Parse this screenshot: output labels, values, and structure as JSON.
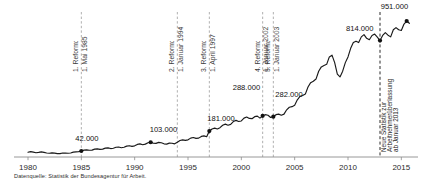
{
  "source_note": "Datenquelle: Statistik der Bundesagentur für Arbeit.",
  "chart_data": {
    "type": "line",
    "title": "",
    "subtitle": "",
    "xlabel": "",
    "ylabel": "",
    "grid": false,
    "legend": "none",
    "xlim": [
      1980,
      2016
    ],
    "ylim": [
      0,
      1000000
    ],
    "x_tick_labels": [
      "1980",
      "1985",
      "1990",
      "1995",
      "2000",
      "2005",
      "2010",
      "2015"
    ],
    "x_ticks": [
      1980,
      1985,
      1990,
      1995,
      2000,
      2005,
      2010,
      2015
    ],
    "series": [
      {
        "name": "Zeitarbeitnehmer",
        "color": "#1a1a1a",
        "x": [
          1980.0,
          1980.25,
          1980.5,
          1980.75,
          1981.0,
          1981.25,
          1981.5,
          1981.75,
          1982.0,
          1982.25,
          1982.5,
          1982.75,
          1983.0,
          1983.25,
          1983.5,
          1983.75,
          1984.0,
          1984.25,
          1984.5,
          1984.75,
          1985.0,
          1985.25,
          1985.5,
          1985.75,
          1986.0,
          1986.25,
          1986.5,
          1986.75,
          1987.0,
          1987.25,
          1987.5,
          1987.75,
          1988.0,
          1988.25,
          1988.5,
          1988.75,
          1989.0,
          1989.25,
          1989.5,
          1989.75,
          1990.0,
          1990.25,
          1990.5,
          1990.75,
          1991.0,
          1991.25,
          1991.5,
          1991.75,
          1992.0,
          1992.25,
          1992.5,
          1992.75,
          1993.0,
          1993.25,
          1993.5,
          1993.75,
          1994.0,
          1994.25,
          1994.5,
          1994.75,
          1995.0,
          1995.25,
          1995.5,
          1995.75,
          1996.0,
          1996.25,
          1996.5,
          1996.75,
          1997.0,
          1997.25,
          1997.5,
          1997.75,
          1998.0,
          1998.25,
          1998.5,
          1998.75,
          1999.0,
          1999.25,
          1999.5,
          1999.75,
          2000.0,
          2000.25,
          2000.5,
          2000.75,
          2001.0,
          2001.25,
          2001.5,
          2001.75,
          2002.0,
          2002.25,
          2002.5,
          2002.75,
          2003.0,
          2003.25,
          2003.5,
          2003.75,
          2004.0,
          2004.25,
          2004.5,
          2004.75,
          2005.0,
          2005.25,
          2005.5,
          2005.75,
          2006.0,
          2006.25,
          2006.5,
          2006.75,
          2007.0,
          2007.25,
          2007.5,
          2007.75,
          2008.0,
          2008.25,
          2008.5,
          2008.75,
          2009.0,
          2009.25,
          2009.5,
          2009.75,
          2010.0,
          2010.25,
          2010.5,
          2010.75,
          2011.0,
          2011.25,
          2011.5,
          2011.75,
          2012.0,
          2012.25,
          2012.5,
          2012.75,
          2013.0,
          2013.25,
          2013.5,
          2013.75,
          2014.0,
          2014.25,
          2014.5,
          2014.75,
          2015.0,
          2015.25,
          2015.5,
          2015.75
        ],
        "values": [
          33000,
          38000,
          34000,
          30000,
          32000,
          36000,
          32000,
          28000,
          26000,
          29000,
          27000,
          24000,
          24000,
          28000,
          27000,
          26000,
          28000,
          34000,
          36000,
          38000,
          42000,
          48000,
          50000,
          47000,
          48000,
          55000,
          57000,
          53000,
          55000,
          62000,
          64000,
          59000,
          61000,
          68000,
          70000,
          65000,
          68000,
          76000,
          79000,
          74000,
          78000,
          88000,
          92000,
          86000,
          90000,
          100000,
          103000,
          96000,
          95000,
          102000,
          100000,
          92000,
          90000,
          97000,
          96000,
          92000,
          103000,
          115000,
          120000,
          116000,
          120000,
          132000,
          136000,
          130000,
          132000,
          144000,
          148000,
          142000,
          181000,
          196000,
          202000,
          196000,
          205000,
          222000,
          230000,
          222000,
          228000,
          248000,
          256000,
          248000,
          252000,
          272000,
          280000,
          270000,
          268000,
          282000,
          286000,
          272000,
          288000,
          296000,
          292000,
          276000,
          282000,
          296000,
          300000,
          292000,
          300000,
          330000,
          348000,
          352000,
          362000,
          400000,
          424000,
          430000,
          440000,
          490000,
          520000,
          530000,
          545000,
          600000,
          630000,
          640000,
          648000,
          700000,
          712000,
          660000,
          580000,
          560000,
          600000,
          660000,
          700000,
          760000,
          800000,
          810000,
          800000,
          840000,
          856000,
          830000,
          820000,
          850000,
          860000,
          838000,
          814000,
          850000,
          870000,
          852000,
          840000,
          890000,
          905000,
          890000,
          885000,
          930000,
          951000,
          935000
        ]
      }
    ],
    "annotated_points": [
      {
        "label": "42.000",
        "x": 1985.0,
        "y": 42000,
        "label_dx": -6,
        "label_dy": -10
      },
      {
        "label": "103.000",
        "x": 1991.5,
        "y": 103000,
        "label_dx": -1,
        "label_dy": -10
      },
      {
        "label": "181.000",
        "x": 1997.0,
        "y": 181000,
        "label_dx": -2,
        "label_dy": -10
      },
      {
        "label": "288.000",
        "x": 2002.0,
        "y": 288000,
        "label_dx": -30,
        "label_dy": -26
      },
      {
        "label": "282.000",
        "x": 2003.0,
        "y": 282000,
        "label_dx": 2,
        "label_dy": -20
      },
      {
        "label": "814.000",
        "x": 2013.0,
        "y": 814000,
        "label_dx": -34,
        "label_dy": -10
      },
      {
        "label": "951.000",
        "x": 2015.5,
        "y": 951000,
        "label_dx": -26,
        "label_dy": -12
      }
    ],
    "reform_markers": [
      {
        "id": "reform-1",
        "x": 1985.0,
        "line1": "1. Reform:",
        "line2": "1. Mai 1985",
        "style": "light"
      },
      {
        "id": "reform-2",
        "x": 1994.0,
        "line1": "2. Reform:",
        "line2": "1. Januar 1994",
        "style": "light"
      },
      {
        "id": "reform-3",
        "x": 1997.0,
        "line1": "3. Reform:",
        "line2": "1. April 1997",
        "style": "light"
      },
      {
        "id": "reform-4",
        "x": 2002.0,
        "line1": "4. Reform:",
        "line2": "1. Januar 2002",
        "style": "light"
      },
      {
        "id": "reform-5",
        "x": 2003.0,
        "line1": "5. Reform:",
        "line2": "1. Januar 2003",
        "style": "light"
      }
    ],
    "statistics_marker": {
      "id": "statistik-2013",
      "x": 2013.0,
      "line1": "Neue Statistik zur",
      "line2": "Arbeitnehmerüberlassung",
      "line3": "ab Januar 2013",
      "style": "dark"
    },
    "colors": {
      "line": "#1a1a1a",
      "axis": "#8c8c8c",
      "reform_dash": "#9a9a9a",
      "statistics_dash": "#2a2a2a",
      "point": "#111111",
      "text": "#1a1a1a"
    }
  }
}
